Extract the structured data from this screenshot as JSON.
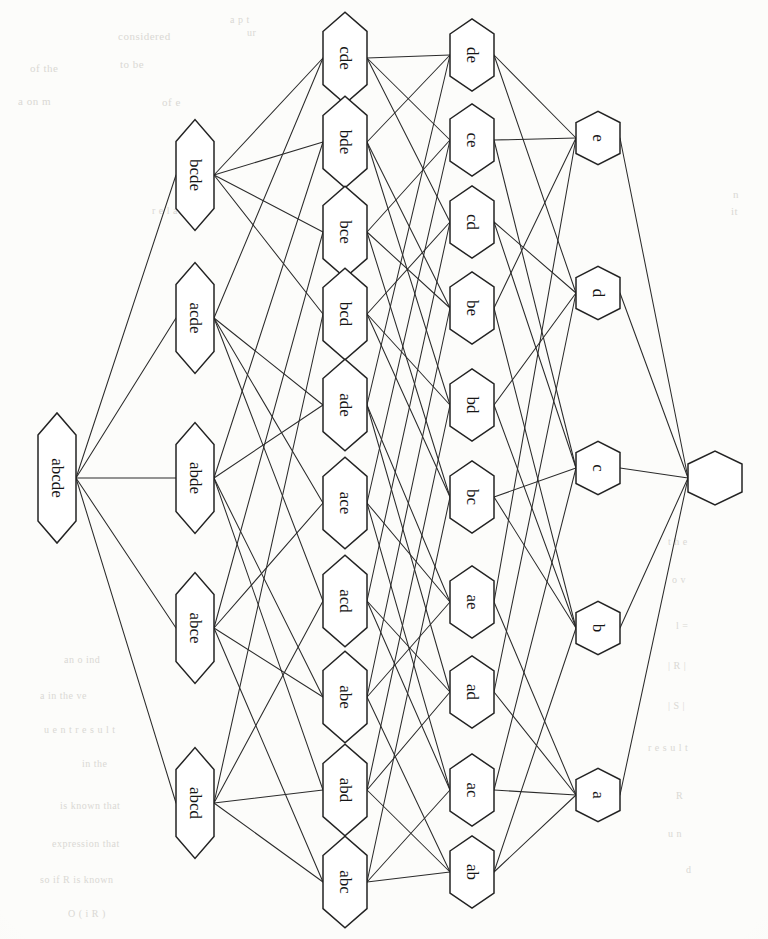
{
  "figure": {
    "kind": "hasse-diagram",
    "title": "",
    "orientation": "left-to-right, labels rotated 90 degrees clockwise",
    "node_shape": "hexagon",
    "colors": {
      "ink": "#232323",
      "edge": "#2b2b2b",
      "node_fill": "#ffffff",
      "paper": "#fcfcfa",
      "ghost_text": "#cfcdc8"
    }
  },
  "chart_data": {
    "type": "diagram",
    "columns": [
      {
        "rank": 5,
        "x": 57,
        "labels": [
          "abcde"
        ]
      },
      {
        "rank": 4,
        "x": 195,
        "labels": [
          "bcde",
          "acde",
          "abde",
          "abce",
          "abcd"
        ]
      },
      {
        "rank": 3,
        "x": 345,
        "labels": [
          "cde",
          "bde",
          "bce",
          "bcd",
          "ade",
          "ace",
          "acd",
          "abe",
          "abd",
          "abc"
        ]
      },
      {
        "rank": 2,
        "x": 472,
        "labels": [
          "de",
          "ce",
          "cd",
          "be",
          "bd",
          "bc",
          "ae",
          "ad",
          "ac",
          "ab"
        ]
      },
      {
        "rank": 1,
        "x": 598,
        "labels": [
          "e",
          "d",
          "c",
          "b",
          "a"
        ]
      },
      {
        "rank": 0,
        "x": 715,
        "labels": [
          ""
        ]
      }
    ],
    "nodes": [
      {
        "id": "abcde",
        "label": "abcde",
        "x": 57,
        "y": 478,
        "size": 5
      },
      {
        "id": "bcde",
        "label": "bcde",
        "x": 195,
        "y": 175,
        "size": 4
      },
      {
        "id": "acde",
        "label": "acde",
        "x": 195,
        "y": 318,
        "size": 4
      },
      {
        "id": "abde",
        "label": "abde",
        "x": 195,
        "y": 478,
        "size": 4
      },
      {
        "id": "abce",
        "label": "abce",
        "x": 195,
        "y": 628,
        "size": 4
      },
      {
        "id": "abcd",
        "label": "abcd",
        "x": 195,
        "y": 803,
        "size": 4
      },
      {
        "id": "cde",
        "label": "cde",
        "x": 345,
        "y": 58,
        "size": 3
      },
      {
        "id": "bde",
        "label": "bde",
        "x": 345,
        "y": 142,
        "size": 3
      },
      {
        "id": "bce",
        "label": "bce",
        "x": 345,
        "y": 232,
        "size": 3
      },
      {
        "id": "bcd",
        "label": "bcd",
        "x": 345,
        "y": 314,
        "size": 3
      },
      {
        "id": "ade",
        "label": "ade",
        "x": 345,
        "y": 405,
        "size": 3
      },
      {
        "id": "ace",
        "label": "ace",
        "x": 345,
        "y": 503,
        "size": 3
      },
      {
        "id": "acd",
        "label": "acd",
        "x": 345,
        "y": 601,
        "size": 3
      },
      {
        "id": "abe",
        "label": "abe",
        "x": 345,
        "y": 697,
        "size": 3
      },
      {
        "id": "abd",
        "label": "abd",
        "x": 345,
        "y": 790,
        "size": 3
      },
      {
        "id": "abc",
        "label": "abc",
        "x": 345,
        "y": 882,
        "size": 3
      },
      {
        "id": "de",
        "label": "de",
        "x": 472,
        "y": 55,
        "size": 2
      },
      {
        "id": "ce",
        "label": "ce",
        "x": 472,
        "y": 140,
        "size": 2
      },
      {
        "id": "cd",
        "label": "cd",
        "x": 472,
        "y": 222,
        "size": 2
      },
      {
        "id": "be",
        "label": "be",
        "x": 472,
        "y": 308,
        "size": 2
      },
      {
        "id": "bd",
        "label": "bd",
        "x": 472,
        "y": 405,
        "size": 2
      },
      {
        "id": "bc",
        "label": "bc",
        "x": 472,
        "y": 497,
        "size": 2
      },
      {
        "id": "ae",
        "label": "ae",
        "x": 472,
        "y": 602,
        "size": 2
      },
      {
        "id": "ad",
        "label": "ad",
        "x": 472,
        "y": 692,
        "size": 2
      },
      {
        "id": "ac",
        "label": "ac",
        "x": 472,
        "y": 790,
        "size": 2
      },
      {
        "id": "ab",
        "label": "ab",
        "x": 472,
        "y": 872,
        "size": 2
      },
      {
        "id": "e",
        "label": "e",
        "x": 598,
        "y": 138,
        "size": 1
      },
      {
        "id": "d",
        "label": "d",
        "x": 598,
        "y": 293,
        "size": 1
      },
      {
        "id": "c",
        "label": "c",
        "x": 598,
        "y": 468,
        "size": 1
      },
      {
        "id": "b",
        "label": "b",
        "x": 598,
        "y": 628,
        "size": 1
      },
      {
        "id": "a",
        "label": "a",
        "x": 598,
        "y": 795,
        "size": 1
      },
      {
        "id": "empty",
        "label": "",
        "x": 715,
        "y": 478,
        "size": 0
      }
    ],
    "edges": [
      [
        "abcde",
        "bcde"
      ],
      [
        "abcde",
        "acde"
      ],
      [
        "abcde",
        "abde"
      ],
      [
        "abcde",
        "abce"
      ],
      [
        "abcde",
        "abcd"
      ],
      [
        "bcde",
        "cde"
      ],
      [
        "bcde",
        "bde"
      ],
      [
        "bcde",
        "bce"
      ],
      [
        "bcde",
        "bcd"
      ],
      [
        "acde",
        "cde"
      ],
      [
        "acde",
        "ade"
      ],
      [
        "acde",
        "ace"
      ],
      [
        "acde",
        "acd"
      ],
      [
        "abde",
        "bde"
      ],
      [
        "abde",
        "ade"
      ],
      [
        "abde",
        "abe"
      ],
      [
        "abde",
        "abd"
      ],
      [
        "abce",
        "bce"
      ],
      [
        "abce",
        "ace"
      ],
      [
        "abce",
        "abe"
      ],
      [
        "abce",
        "abc"
      ],
      [
        "abcd",
        "bcd"
      ],
      [
        "abcd",
        "acd"
      ],
      [
        "abcd",
        "abd"
      ],
      [
        "abcd",
        "abc"
      ],
      [
        "cde",
        "de"
      ],
      [
        "cde",
        "ce"
      ],
      [
        "cde",
        "cd"
      ],
      [
        "bde",
        "de"
      ],
      [
        "bde",
        "be"
      ],
      [
        "bde",
        "bd"
      ],
      [
        "bce",
        "ce"
      ],
      [
        "bce",
        "be"
      ],
      [
        "bce",
        "bc"
      ],
      [
        "bcd",
        "cd"
      ],
      [
        "bcd",
        "bd"
      ],
      [
        "bcd",
        "bc"
      ],
      [
        "ade",
        "de"
      ],
      [
        "ade",
        "ae"
      ],
      [
        "ade",
        "ad"
      ],
      [
        "ace",
        "ce"
      ],
      [
        "ace",
        "ae"
      ],
      [
        "ace",
        "ac"
      ],
      [
        "acd",
        "cd"
      ],
      [
        "acd",
        "ad"
      ],
      [
        "acd",
        "ac"
      ],
      [
        "abe",
        "be"
      ],
      [
        "abe",
        "ae"
      ],
      [
        "abe",
        "ab"
      ],
      [
        "abd",
        "bd"
      ],
      [
        "abd",
        "ad"
      ],
      [
        "abd",
        "ab"
      ],
      [
        "abc",
        "bc"
      ],
      [
        "abc",
        "ac"
      ],
      [
        "abc",
        "ab"
      ],
      [
        "de",
        "d"
      ],
      [
        "de",
        "e"
      ],
      [
        "ce",
        "c"
      ],
      [
        "ce",
        "e"
      ],
      [
        "cd",
        "c"
      ],
      [
        "cd",
        "d"
      ],
      [
        "be",
        "b"
      ],
      [
        "be",
        "e"
      ],
      [
        "bd",
        "b"
      ],
      [
        "bd",
        "d"
      ],
      [
        "bc",
        "b"
      ],
      [
        "bc",
        "c"
      ],
      [
        "ae",
        "a"
      ],
      [
        "ae",
        "e"
      ],
      [
        "ad",
        "a"
      ],
      [
        "ad",
        "d"
      ],
      [
        "ac",
        "a"
      ],
      [
        "ac",
        "c"
      ],
      [
        "ab",
        "a"
      ],
      [
        "ab",
        "b"
      ],
      [
        "e",
        "empty"
      ],
      [
        "d",
        "empty"
      ],
      [
        "c",
        "empty"
      ],
      [
        "b",
        "empty"
      ],
      [
        "a",
        "empty"
      ]
    ]
  },
  "ghosts": [
    {
      "text": "considered",
      "x": 118,
      "y": 30,
      "size": 11
    },
    {
      "text": "a  p t",
      "x": 230,
      "y": 14,
      "size": 10
    },
    {
      "text": "ur",
      "x": 247,
      "y": 27,
      "size": 10
    },
    {
      "text": "of the",
      "x": 30,
      "y": 62,
      "size": 11
    },
    {
      "text": "to be",
      "x": 120,
      "y": 58,
      "size": 11
    },
    {
      "text": "a   on  m",
      "x": 18,
      "y": 95,
      "size": 11
    },
    {
      "text": "of   e",
      "x": 162,
      "y": 96,
      "size": 11
    },
    {
      "text": "r e l a t i o n",
      "x": 152,
      "y": 205,
      "size": 10
    },
    {
      "text": "n",
      "x": 733,
      "y": 188,
      "size": 11
    },
    {
      "text": "it",
      "x": 731,
      "y": 205,
      "size": 11
    },
    {
      "text": "m",
      "x": 52,
      "y": 412,
      "size": 11
    },
    {
      "text": "an   o   ind",
      "x": 64,
      "y": 654,
      "size": 10
    },
    {
      "text": "a  in  the   ve",
      "x": 40,
      "y": 690,
      "size": 10
    },
    {
      "text": "u e n t   r e s u l t",
      "x": 44,
      "y": 724,
      "size": 10
    },
    {
      "text": "in   the",
      "x": 82,
      "y": 758,
      "size": 10
    },
    {
      "text": "is  known   that",
      "x": 60,
      "y": 800,
      "size": 10
    },
    {
      "text": "expression   that",
      "x": 52,
      "y": 838,
      "size": 10
    },
    {
      "text": "so   if   R  is  known",
      "x": 40,
      "y": 874,
      "size": 10
    },
    {
      "text": "O   ( i R  )",
      "x": 68,
      "y": 908,
      "size": 10
    },
    {
      "text": "t h e",
      "x": 668,
      "y": 536,
      "size": 10
    },
    {
      "text": "o   v",
      "x": 672,
      "y": 574,
      "size": 10
    },
    {
      "text": "l  =",
      "x": 676,
      "y": 620,
      "size": 10
    },
    {
      "text": "|  R  |",
      "x": 668,
      "y": 660,
      "size": 10
    },
    {
      "text": "|  S  |",
      "x": 668,
      "y": 700,
      "size": 10
    },
    {
      "text": "r e s u l t",
      "x": 648,
      "y": 742,
      "size": 10
    },
    {
      "text": "R",
      "x": 676,
      "y": 790,
      "size": 10
    },
    {
      "text": "u n",
      "x": 668,
      "y": 828,
      "size": 10
    },
    {
      "text": "d",
      "x": 686,
      "y": 864,
      "size": 10
    }
  ]
}
